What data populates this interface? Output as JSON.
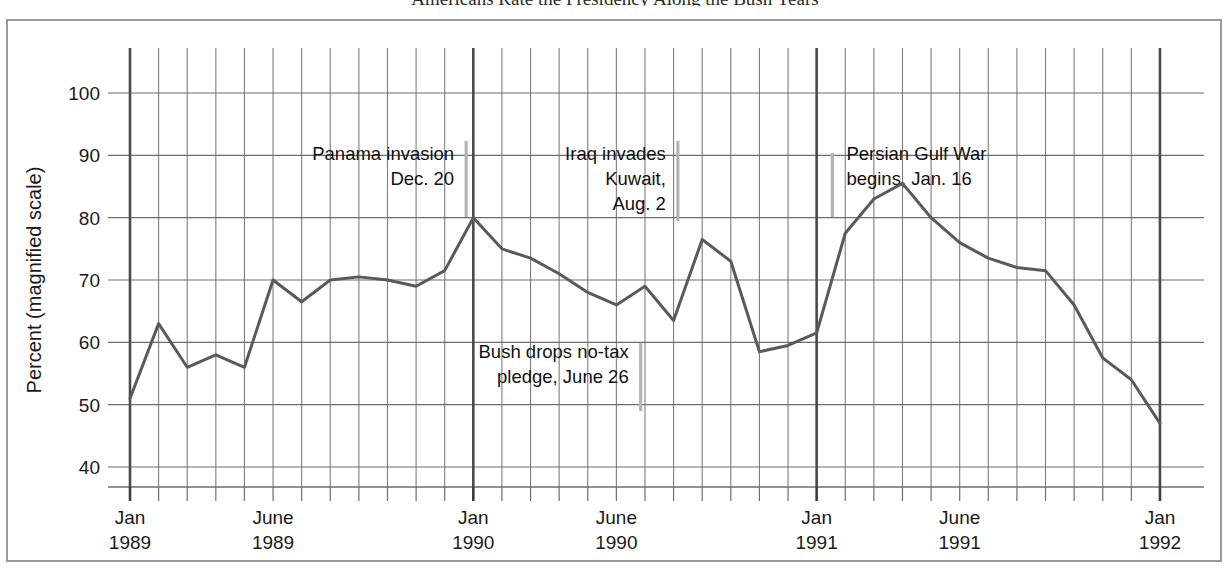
{
  "figure": {
    "headline_fragment": "Americans Rate the Presidency Along the Bush Years",
    "frame_color": "#9a9a9a",
    "background": "#ffffff"
  },
  "axes": {
    "y_title": "Percent (magnified scale)",
    "y_ticks": [
      "40",
      "50",
      "60",
      "70",
      "80",
      "90",
      "100"
    ],
    "x_ticks": [
      {
        "line1": "Jan",
        "line2": "1989"
      },
      {
        "line1": "June",
        "line2": "1989"
      },
      {
        "line1": "Jan",
        "line2": "1990"
      },
      {
        "line1": "June",
        "line2": "1990"
      },
      {
        "line1": "Jan",
        "line2": "1991"
      },
      {
        "line1": "June",
        "line2": "1991"
      },
      {
        "line1": "Jan",
        "line2": "1992"
      }
    ]
  },
  "annotations": [
    {
      "name": "panama-invasion",
      "lines": [
        "Panama invasion",
        "Dec. 20"
      ],
      "align": "right"
    },
    {
      "name": "iraq-invades",
      "lines": [
        "Iraq invades",
        "Kuwait,",
        "Aug. 2"
      ],
      "align": "right"
    },
    {
      "name": "persian-gulf-war",
      "lines": [
        "Persian Gulf War",
        "begins, Jan. 16"
      ],
      "align": "left"
    },
    {
      "name": "bush-no-tax-pledge",
      "lines": [
        "Bush drops no-tax",
        "pledge, June 26"
      ],
      "align": "right"
    }
  ],
  "chart_data": {
    "type": "line",
    "title": "Americans Rate the Presidency Along the Bush Years",
    "xlabel": "",
    "ylabel": "Percent (magnified scale)",
    "ylim": [
      38,
      106
    ],
    "yticks": [
      40,
      50,
      60,
      70,
      80,
      90,
      100
    ],
    "grid": true,
    "legend": "none",
    "line_color": "#5a5a5a",
    "x_start": "1989-01",
    "x_end": "1992-01",
    "x_step_months": 1,
    "x": [
      "Jan 1989",
      "Feb 1989",
      "Mar 1989",
      "Apr 1989",
      "May 1989",
      "June 1989",
      "July 1989",
      "Aug 1989",
      "Sept 1989",
      "Oct 1989",
      "Nov 1989",
      "Dec 1989",
      "Jan 1990",
      "Feb 1990",
      "Mar 1990",
      "Apr 1990",
      "May 1990",
      "June 1990",
      "July 1990",
      "Aug 1990",
      "Sept 1990",
      "Oct 1990",
      "Nov 1990",
      "Dec 1990",
      "Jan 1991",
      "Feb 1991",
      "Mar 1991",
      "Apr 1991",
      "May 1991",
      "June 1991",
      "July 1991",
      "Aug 1991",
      "Sept 1991",
      "Oct 1991",
      "Nov 1991",
      "Dec 1991",
      "Jan 1992"
    ],
    "values": [
      51,
      63,
      56,
      58,
      56,
      70,
      66.5,
      70,
      70.5,
      70,
      69,
      71.5,
      80,
      75,
      73.5,
      71,
      68,
      66,
      69,
      63.5,
      76.5,
      73,
      58.5,
      59.5,
      61.5,
      77.5,
      83,
      85.5,
      80,
      76,
      73.5,
      72,
      71.5,
      66,
      57.5,
      54,
      47
    ],
    "events": [
      {
        "label": "Panama invasion, Dec. 20",
        "x": "Dec 1989",
        "x_offset_months": 11.7
      },
      {
        "label": "Bush drops no-tax pledge, June 26",
        "x": "June 1990",
        "x_offset_months": 17.8
      },
      {
        "label": "Iraq invades Kuwait, Aug. 2",
        "x": "Aug 1990",
        "x_offset_months": 19.1
      },
      {
        "label": "Persian Gulf War begins, Jan. 16",
        "x": "Jan 1991",
        "x_offset_months": 24.5
      }
    ]
  }
}
